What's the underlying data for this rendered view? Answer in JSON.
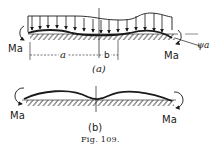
{
  "figure": {
    "caption": "Fig. 109.",
    "panel_a": {
      "label": "(a)",
      "moment_left": "Ma",
      "moment_right": "Ma",
      "dim_a": "a",
      "dim_b": "b",
      "angle": "ψa"
    },
    "panel_b": {
      "label": "(b)",
      "moment_left": "Ma",
      "moment_right": "Ma"
    }
  },
  "colors": {
    "ink": "#1a1a1a",
    "background": "#ffffff"
  }
}
